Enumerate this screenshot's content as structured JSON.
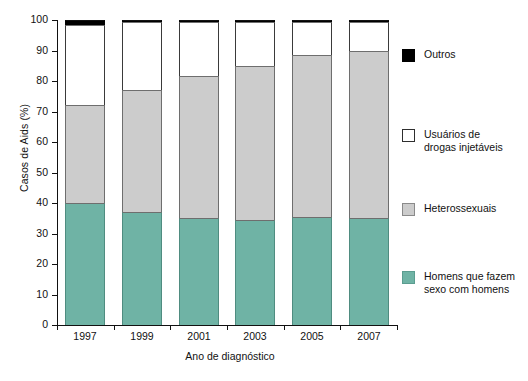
{
  "chart_data": {
    "type": "bar",
    "subtype": "stacked-percentage",
    "title": "",
    "xlabel": "Ano de diagnóstico",
    "ylabel": "Casos de Aids (%)",
    "categories": [
      "1997",
      "1999",
      "2001",
      "2003",
      "2005",
      "2007"
    ],
    "ylim": [
      0,
      100
    ],
    "yticks": [
      0,
      10,
      20,
      30,
      40,
      50,
      60,
      70,
      80,
      90,
      100
    ],
    "ytick_labels": [
      "0",
      "10",
      "20",
      "30",
      "40",
      "50",
      "60",
      "70",
      "80",
      "90",
      "100"
    ],
    "grid": false,
    "legend_position": "right",
    "stack_order_bottom_to_top": [
      "msm",
      "hetero",
      "udi",
      "outros"
    ],
    "series": [
      {
        "key": "msm",
        "name": "Homens que fazem sexo com homens",
        "color": "#6fb3a5",
        "values": [
          40.0,
          37.0,
          35.0,
          34.5,
          35.5,
          35.0
        ]
      },
      {
        "key": "hetero",
        "name": "Heterossexuais",
        "color": "#cccccc",
        "values": [
          32.0,
          40.0,
          46.5,
          50.5,
          53.0,
          55.0
        ]
      },
      {
        "key": "udi",
        "name": "Usuários de drogas injetáveis",
        "color": "#ffffff",
        "values": [
          26.5,
          22.5,
          18.0,
          14.5,
          11.0,
          9.5
        ]
      },
      {
        "key": "outros",
        "name": "Outros",
        "color": "#000000",
        "values": [
          1.5,
          0.5,
          0.5,
          0.5,
          0.5,
          0.5
        ]
      }
    ],
    "cumulative_tops": {
      "msm": [
        40.0,
        37.0,
        35.0,
        34.5,
        35.5,
        35.0
      ],
      "hetero": [
        72.0,
        77.0,
        81.5,
        85.0,
        88.5,
        90.0
      ],
      "udi": [
        98.5,
        99.5,
        99.5,
        99.5,
        99.5,
        99.5
      ],
      "outros": [
        100.0,
        100.0,
        100.0,
        100.0,
        100.0,
        100.0
      ]
    }
  },
  "axes": {
    "y_title": "Casos de Aids (%)",
    "x_title": "Ano de diagnóstico",
    "y_tick_labels": [
      "100",
      "90",
      "80",
      "70",
      "60",
      "50",
      "40",
      "30",
      "20",
      "10",
      "0"
    ],
    "x_tick_labels": [
      "1997",
      "1999",
      "2001",
      "2003",
      "2005",
      "2007"
    ]
  },
  "legend": {
    "items": [
      {
        "label": "Outros",
        "key": "outros",
        "color": "#000000"
      },
      {
        "label": "Usuários de\ndrogas injetáveis",
        "key": "udi",
        "color": "#ffffff"
      },
      {
        "label": "Heterossexuais",
        "key": "hetero",
        "color": "#cccccc"
      },
      {
        "label": "Homens que fazem\nsexo com homens",
        "key": "msm",
        "color": "#6fb3a5"
      }
    ]
  }
}
